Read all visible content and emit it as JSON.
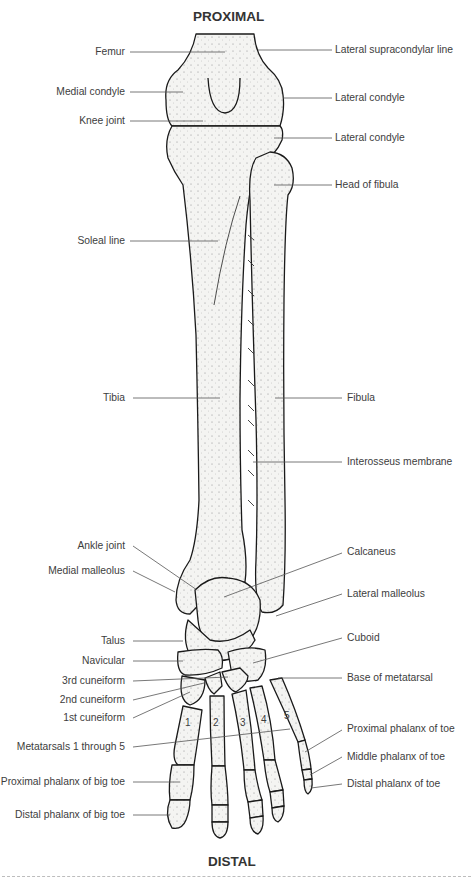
{
  "diagram": {
    "title_top": "PROXIMAL",
    "title_bottom": "DISTAL",
    "colors": {
      "bone_fill": "#f4f4f2",
      "outline": "#1a1a1a",
      "leader": "#555555",
      "text": "#3d3d3d"
    },
    "labels_left": [
      {
        "id": "femur",
        "text": "Femur"
      },
      {
        "id": "medial-condyle",
        "text": "Medial condyle"
      },
      {
        "id": "knee-joint",
        "text": "Knee joint"
      },
      {
        "id": "soleal-line",
        "text": "Soleal line"
      },
      {
        "id": "tibia",
        "text": "Tibia"
      },
      {
        "id": "ankle-joint",
        "text": "Ankle joint"
      },
      {
        "id": "medial-malleolus",
        "text": "Medial malleolus"
      },
      {
        "id": "talus",
        "text": "Talus"
      },
      {
        "id": "navicular",
        "text": "Navicular"
      },
      {
        "id": "3rd-cuneiform",
        "text": "3rd cuneiform"
      },
      {
        "id": "2nd-cuneiform",
        "text": "2nd cuneiform"
      },
      {
        "id": "1st-cuneiform",
        "text": "1st cuneiform"
      },
      {
        "id": "metatarsals",
        "text": "Metatarsals 1 through 5"
      },
      {
        "id": "proximal-phalanx-big-toe",
        "text": "Proximal phalanx of big toe"
      },
      {
        "id": "distal-phalanx-big-toe",
        "text": "Distal phalanx of big toe"
      }
    ],
    "labels_right": [
      {
        "id": "lateral-supracondylar-line",
        "text": "Lateral supracondylar line"
      },
      {
        "id": "lateral-condyle-femur",
        "text": "Lateral condyle"
      },
      {
        "id": "lateral-condyle-tibia",
        "text": "Lateral condyle"
      },
      {
        "id": "head-of-fibula",
        "text": "Head of fibula"
      },
      {
        "id": "fibula",
        "text": "Fibula"
      },
      {
        "id": "interosseus-membrane",
        "text": "Interosseus membrane"
      },
      {
        "id": "calcaneus",
        "text": "Calcaneus"
      },
      {
        "id": "lateral-malleolus",
        "text": "Lateral malleolus"
      },
      {
        "id": "cuboid",
        "text": "Cuboid"
      },
      {
        "id": "base-of-metatarsal",
        "text": "Base of metatarsal"
      },
      {
        "id": "proximal-phalanx-toe",
        "text": "Proximal phalanx of toe"
      },
      {
        "id": "middle-phalanx-toe",
        "text": "Middle phalanx of toe"
      },
      {
        "id": "distal-phalanx-toe",
        "text": "Distal phalanx of toe"
      }
    ],
    "metatarsal_numbers": [
      "1",
      "2",
      "3",
      "4",
      "5"
    ]
  }
}
